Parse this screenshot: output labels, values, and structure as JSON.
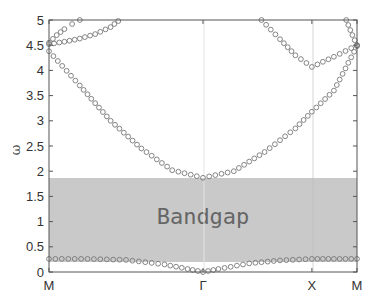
{
  "chart_data": {
    "type": "scatter",
    "title": "",
    "xlabel": "",
    "ylabel": "ω",
    "ylim": [
      0,
      5
    ],
    "yticks": [
      0,
      0.5,
      1,
      1.5,
      2,
      2.5,
      3,
      3.5,
      4,
      4.5,
      5
    ],
    "ytick_labels": [
      "0",
      "0.5",
      "1",
      "1.5",
      "2",
      "2.5",
      "3",
      "3.5",
      "4",
      "4.5",
      "5"
    ],
    "xticks": [
      {
        "label": "M",
        "pos": 0
      },
      {
        "label": "Γ",
        "pos": 1
      },
      {
        "label": "X",
        "pos": 1.707
      },
      {
        "label": "M",
        "pos": 2.0
      }
    ],
    "grid": false,
    "legend": null,
    "annotations": [
      {
        "text": "Bandgap",
        "region": {
          "ymin": 0.27,
          "ymax": 1.85
        },
        "color": "#c8c8c8"
      }
    ],
    "marker": "open-circle",
    "marker_color": "#777777",
    "series": [
      {
        "name": "band-1",
        "x": [
          0,
          0.25,
          0.5,
          0.75,
          0.9,
          1.0,
          1.1,
          1.3,
          1.5,
          1.707,
          1.85,
          2.0
        ],
        "y": [
          0.26,
          0.26,
          0.24,
          0.15,
          0.06,
          0.0,
          0.06,
          0.17,
          0.23,
          0.26,
          0.26,
          0.26
        ]
      },
      {
        "name": "band-2",
        "x": [
          0,
          0.2,
          0.4,
          0.6,
          0.8,
          1.0,
          1.2,
          1.4,
          1.6,
          1.707,
          1.85,
          2.0
        ],
        "y": [
          4.38,
          3.7,
          3.0,
          2.45,
          2.02,
          1.87,
          2.0,
          2.38,
          2.85,
          3.18,
          3.6,
          4.48
        ]
      },
      {
        "name": "band-3",
        "x": [
          0,
          0.1,
          0.2,
          0.3,
          0.4,
          0.45
        ],
        "y": [
          4.52,
          4.57,
          4.63,
          4.72,
          4.86,
          4.98
        ]
      },
      {
        "name": "band-4",
        "x": [
          0,
          0.05,
          0.1,
          0.15,
          0.2
        ],
        "y": [
          4.55,
          4.7,
          4.82,
          4.92,
          5.0
        ]
      },
      {
        "name": "band-5",
        "x": [
          1.38,
          1.5,
          1.6,
          1.707,
          1.85,
          2.0
        ],
        "y": [
          5.0,
          4.62,
          4.3,
          4.07,
          4.27,
          4.5
        ]
      },
      {
        "name": "band-6",
        "x": [
          1.93,
          1.97,
          2.0
        ],
        "y": [
          5.0,
          4.7,
          4.5
        ]
      }
    ]
  }
}
